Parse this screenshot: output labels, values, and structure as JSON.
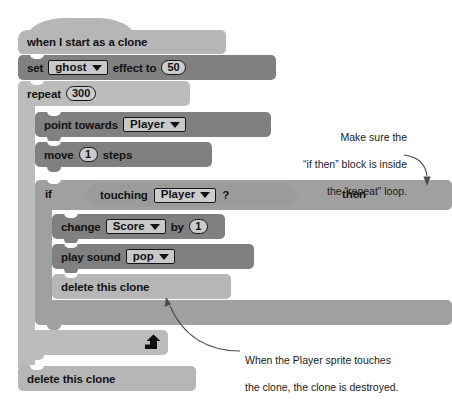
{
  "script": {
    "title": "Clone script",
    "blocks": [
      {
        "id": "hat",
        "kind": "hat",
        "label": "when I start as a clone"
      },
      {
        "id": "set-effect",
        "kind": "stack",
        "label_a": "set",
        "dropdown": "ghost",
        "label_b": "effect to",
        "value": "50"
      },
      {
        "id": "repeat",
        "kind": "c-block",
        "label": "repeat",
        "value": "300"
      },
      {
        "id": "point-towards",
        "kind": "stack",
        "label_a": "point towards",
        "dropdown": "Player"
      },
      {
        "id": "move",
        "kind": "stack",
        "label_a": "move",
        "value": "1",
        "label_b": "steps"
      },
      {
        "id": "if-then",
        "kind": "c-block",
        "label_a": "if",
        "label_b": "then",
        "condition_label": "touching",
        "condition_dropdown": "Player",
        "condition_suffix": "?"
      },
      {
        "id": "change-var",
        "kind": "stack",
        "label_a": "change",
        "dropdown": "Score",
        "label_b": "by",
        "value": "1"
      },
      {
        "id": "play-sound",
        "kind": "stack",
        "label_a": "play sound",
        "dropdown": "pop"
      },
      {
        "id": "delete-clone-inner",
        "kind": "stack",
        "label_a": "delete this clone"
      },
      {
        "id": "delete-clone-outer",
        "kind": "stack",
        "label_a": "delete this clone"
      }
    ]
  },
  "annotations": {
    "top": {
      "line1": "Make sure the",
      "line2": "“if then” block is inside",
      "line3": "the “repeat” loop."
    },
    "bottom": {
      "line1": "When the Player sprite touches",
      "line2": "the clone, the clone is destroyed."
    }
  },
  "icons": {
    "loop_arrow": "loop-arrow-icon",
    "caret": "chevron-down-icon"
  },
  "colors": {
    "block_light": "#b6b6b6",
    "block_dark": "#808080",
    "block_mid": "#a0a0a0",
    "field_fill": "#cccccc",
    "text": "#121212",
    "background": "#ffffff"
  }
}
